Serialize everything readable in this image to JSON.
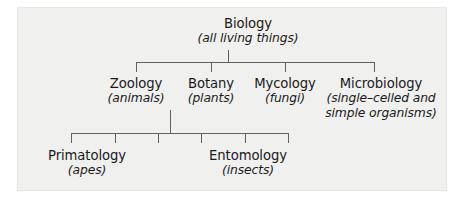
{
  "diagram": {
    "type": "tree",
    "background_color": "#f0f0ef",
    "line_color": "#5f6163",
    "text_color": "#1a1a1a",
    "levels": [
      {
        "level": 1,
        "nodes": [
          {
            "id": "biology",
            "name": "Biology",
            "desc": "(all living things)"
          }
        ]
      },
      {
        "level": 2,
        "parent": "biology",
        "nodes": [
          {
            "id": "zoology",
            "name": "Zoology",
            "desc": "(animals)"
          },
          {
            "id": "botany",
            "name": "Botany",
            "desc": "(plants)"
          },
          {
            "id": "mycology",
            "name": "Mycology",
            "desc": "(fungi)"
          },
          {
            "id": "microbiology",
            "name": "Microbiology",
            "desc": "(single–celled and",
            "desc2": "simple organisms)"
          }
        ]
      },
      {
        "level": 3,
        "parent": "zoology",
        "nodes": [
          {
            "id": "primatology",
            "name": "Primatology",
            "desc": "(apes)"
          },
          {
            "id": "entomology",
            "name": "Entomology",
            "desc": "(insects)"
          }
        ]
      }
    ]
  }
}
